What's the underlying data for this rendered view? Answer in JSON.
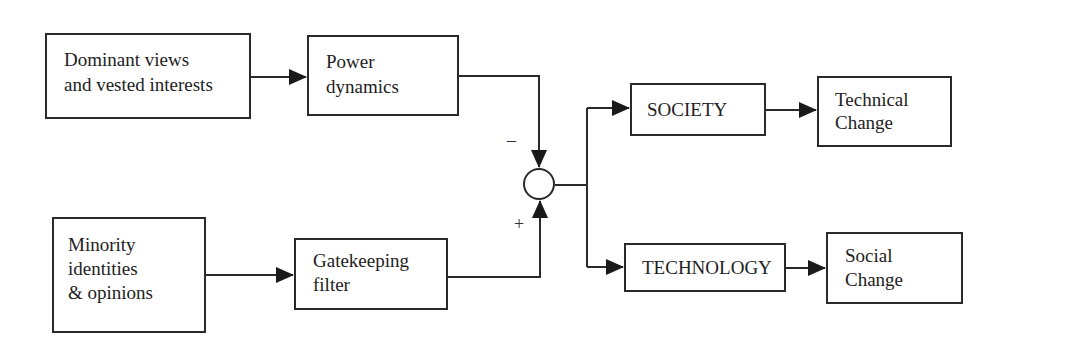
{
  "diagram": {
    "nodes": {
      "dominant": {
        "line1": "Dominant views",
        "line2": "and vested interests"
      },
      "power": {
        "line1": "Power",
        "line2": "dynamics"
      },
      "minority": {
        "line1": "Minority",
        "line2": "identities",
        "line3": "& opinions"
      },
      "gatekeeping": {
        "line1": "Gatekeeping",
        "line2": "filter"
      },
      "society": {
        "label": "SOCIETY"
      },
      "technology": {
        "label": "TECHNOLOGY"
      },
      "technical_change": {
        "line1": "Technical",
        "line2": "Change"
      },
      "social_change": {
        "line1": "Social",
        "line2": "Change"
      }
    },
    "summing_junction": {
      "minus_sign": "–",
      "plus_sign": "+"
    },
    "edges": [
      {
        "from": "Dominant views and vested interests",
        "to": "Power dynamics"
      },
      {
        "from": "Power dynamics",
        "to": "summing junction",
        "sign": "-"
      },
      {
        "from": "Minority identities & opinions",
        "to": "Gatekeeping filter"
      },
      {
        "from": "Gatekeeping filter",
        "to": "summing junction",
        "sign": "+"
      },
      {
        "from": "summing junction",
        "to": "SOCIETY"
      },
      {
        "from": "summing junction",
        "to": "TECHNOLOGY"
      },
      {
        "from": "SOCIETY",
        "to": "Technical Change"
      },
      {
        "from": "TECHNOLOGY",
        "to": "Social Change"
      }
    ],
    "colors": {
      "line": "#2a2a2a",
      "background": "#ffffff",
      "text": "#222222"
    }
  }
}
